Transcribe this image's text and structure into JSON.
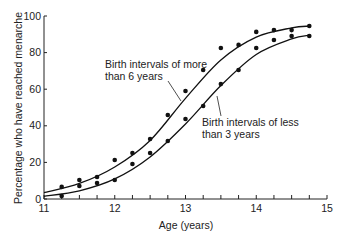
{
  "chart_data": {
    "type": "scatter",
    "title": "",
    "xlabel": "Age (years)",
    "ylabel": "Percentage who have reached menarche",
    "xlim": [
      11,
      15
    ],
    "ylim": [
      0,
      100
    ],
    "x_ticks": [
      11,
      12,
      13,
      14,
      15
    ],
    "x_minor_step": 0.25,
    "y_ticks": [
      0,
      20,
      40,
      60,
      80,
      100
    ],
    "grid": false,
    "legend": "inline annotations",
    "series": [
      {
        "name": "Birth intervals of more than 6 years",
        "label_lines": [
          "Birth intervals of more",
          "than 6 years"
        ],
        "points": [
          [
            11.25,
            6.6
          ],
          [
            11.5,
            10.4
          ],
          [
            11.75,
            12.0
          ],
          [
            12.0,
            21.3
          ],
          [
            12.25,
            25.1
          ],
          [
            12.5,
            32.8
          ],
          [
            12.75,
            45.9
          ],
          [
            13.0,
            59.0
          ],
          [
            13.25,
            70.5
          ],
          [
            13.5,
            82.5
          ],
          [
            13.75,
            84.2
          ],
          [
            14.0,
            91.3
          ],
          [
            14.25,
            92.3
          ],
          [
            14.5,
            92.3
          ],
          [
            14.75,
            94.5
          ]
        ],
        "fit_curve": [
          [
            11.0,
            3.5
          ],
          [
            11.5,
            8.5
          ],
          [
            12.0,
            17.5
          ],
          [
            12.5,
            32.0
          ],
          [
            13.0,
            55.0
          ],
          [
            13.5,
            76.0
          ],
          [
            14.0,
            88.5
          ],
          [
            14.5,
            93.5
          ],
          [
            14.75,
            94.5
          ]
        ]
      },
      {
        "name": "Birth intervals of less than 3 years",
        "label_lines": [
          "Birth intervals of less",
          "than 3 years"
        ],
        "points": [
          [
            11.25,
            1.6
          ],
          [
            11.5,
            7.1
          ],
          [
            11.75,
            8.7
          ],
          [
            12.0,
            10.4
          ],
          [
            12.25,
            19.1
          ],
          [
            12.5,
            25.1
          ],
          [
            12.75,
            31.7
          ],
          [
            13.0,
            43.7
          ],
          [
            13.25,
            50.8
          ],
          [
            13.5,
            62.8
          ],
          [
            13.75,
            70.5
          ],
          [
            14.0,
            82.5
          ],
          [
            14.25,
            86.9
          ],
          [
            14.5,
            89.1
          ],
          [
            14.75,
            89.1
          ]
        ],
        "fit_curve": [
          [
            11.0,
            1.5
          ],
          [
            11.5,
            4.5
          ],
          [
            12.0,
            11.0
          ],
          [
            12.5,
            23.0
          ],
          [
            13.0,
            41.0
          ],
          [
            13.5,
            62.0
          ],
          [
            14.0,
            79.0
          ],
          [
            14.5,
            87.5
          ],
          [
            14.75,
            89.5
          ]
        ]
      }
    ]
  },
  "annotations": {
    "upper": {
      "line1": "Birth intervals of more",
      "line2": "than 6 years"
    },
    "lower": {
      "line1": "Birth intervals of less",
      "line2": "than 3 years"
    }
  },
  "axes": {
    "x_label": "Age (years)",
    "y_label": "Percentage who have reached menarche"
  }
}
